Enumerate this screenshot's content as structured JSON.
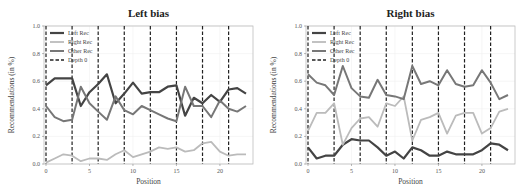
{
  "figure": {
    "panels": [
      {
        "title": "Left bias",
        "xlabel": "Position",
        "ylabel": "Recommendations (in %)"
      },
      {
        "title": "Right bias",
        "xlabel": "Position",
        "ylabel": "Recommendations (in %)"
      }
    ],
    "legend": [
      "Left Rec",
      "Right Rec",
      "Other Rec",
      "Depth 0"
    ],
    "colors": {
      "left": "#444444",
      "right": "#bbbbbb",
      "other": "#777777",
      "depth": "#222222"
    }
  },
  "chart_data": [
    {
      "type": "line",
      "title": "Left bias",
      "xlabel": "Position",
      "ylabel": "Recommendations (in %)",
      "xlim": [
        0,
        23
      ],
      "ylim": [
        0.0,
        1.0
      ],
      "xticks": [
        0,
        5,
        10,
        15,
        20
      ],
      "yticks": [
        0.0,
        0.2,
        0.4,
        0.6,
        0.8,
        1.0
      ],
      "legend_position": "upper left",
      "vlines_depth0": [
        0,
        3,
        6,
        9,
        12,
        15,
        18,
        21
      ],
      "x": [
        0,
        1,
        2,
        3,
        4,
        5,
        6,
        7,
        8,
        9,
        10,
        11,
        12,
        13,
        14,
        15,
        16,
        17,
        18,
        19,
        20,
        21,
        22,
        23
      ],
      "series": [
        {
          "name": "Left Rec",
          "values": [
            0.57,
            0.62,
            0.62,
            0.62,
            0.42,
            0.52,
            0.58,
            0.65,
            0.44,
            0.51,
            0.59,
            0.51,
            0.52,
            0.52,
            0.56,
            0.57,
            0.35,
            0.48,
            0.44,
            0.5,
            0.45,
            0.54,
            0.55,
            0.51
          ]
        },
        {
          "name": "Right Rec",
          "values": [
            0.01,
            0.04,
            0.07,
            0.06,
            0.02,
            0.04,
            0.04,
            0.03,
            0.07,
            0.1,
            0.05,
            0.07,
            0.09,
            0.12,
            0.11,
            0.12,
            0.09,
            0.1,
            0.15,
            0.16,
            0.09,
            0.06,
            0.07,
            0.07
          ]
        },
        {
          "name": "Other Rec",
          "values": [
            0.42,
            0.34,
            0.31,
            0.32,
            0.56,
            0.44,
            0.38,
            0.32,
            0.49,
            0.39,
            0.36,
            0.42,
            0.39,
            0.36,
            0.33,
            0.31,
            0.56,
            0.42,
            0.42,
            0.34,
            0.46,
            0.4,
            0.38,
            0.42
          ]
        }
      ]
    },
    {
      "type": "line",
      "title": "Right bias",
      "xlabel": "Position",
      "ylabel": "Recommendations (in %)",
      "xlim": [
        0,
        23
      ],
      "ylim": [
        0.0,
        1.0
      ],
      "xticks": [
        0,
        5,
        10,
        15,
        20
      ],
      "yticks": [
        0.0,
        0.2,
        0.4,
        0.6,
        0.8,
        1.0
      ],
      "legend_position": "upper left",
      "vlines_depth0": [
        0,
        3,
        6,
        9,
        12,
        15,
        18,
        21
      ],
      "x": [
        0,
        1,
        2,
        3,
        4,
        5,
        6,
        7,
        8,
        9,
        10,
        11,
        12,
        13,
        14,
        15,
        16,
        17,
        18,
        19,
        20,
        21,
        22,
        23
      ],
      "series": [
        {
          "name": "Left Rec",
          "values": [
            0.12,
            0.04,
            0.06,
            0.06,
            0.14,
            0.18,
            0.17,
            0.17,
            0.12,
            0.06,
            0.09,
            0.04,
            0.12,
            0.1,
            0.06,
            0.06,
            0.09,
            0.07,
            0.07,
            0.07,
            0.1,
            0.15,
            0.14,
            0.1
          ]
        },
        {
          "name": "Right Rec",
          "values": [
            0.24,
            0.37,
            0.37,
            0.44,
            0.14,
            0.26,
            0.33,
            0.34,
            0.27,
            0.44,
            0.42,
            0.49,
            0.17,
            0.32,
            0.34,
            0.37,
            0.22,
            0.35,
            0.37,
            0.37,
            0.22,
            0.26,
            0.38,
            0.4
          ]
        },
        {
          "name": "Other Rec",
          "values": [
            0.65,
            0.59,
            0.57,
            0.5,
            0.71,
            0.55,
            0.49,
            0.48,
            0.61,
            0.5,
            0.49,
            0.47,
            0.71,
            0.58,
            0.6,
            0.57,
            0.68,
            0.58,
            0.56,
            0.57,
            0.68,
            0.59,
            0.47,
            0.5
          ]
        }
      ]
    }
  ]
}
